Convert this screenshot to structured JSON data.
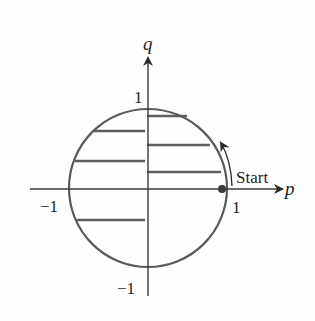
{
  "diagram": {
    "title": "",
    "axes": {
      "x_label": "p",
      "y_label": "q",
      "x_ticks": [
        {
          "value": -1,
          "label": "−1"
        },
        {
          "value": 1,
          "label": "1"
        }
      ],
      "y_ticks": [
        {
          "value": 1,
          "label": "1"
        },
        {
          "value": -1,
          "label": "−1"
        }
      ]
    },
    "circle": {
      "center": [
        0,
        0
      ],
      "radius": 1
    },
    "start_point": {
      "p": 1,
      "q": 0,
      "label": "Start"
    },
    "direction": "counterclockwise",
    "horizontal_segments": [
      {
        "side": "right",
        "q": 0.92
      },
      {
        "side": "right",
        "q": 0.55
      },
      {
        "side": "right",
        "q": 0.21
      },
      {
        "side": "left",
        "q": 0.73
      },
      {
        "side": "left",
        "q": 0.35
      },
      {
        "side": "left",
        "q": -0.39
      }
    ],
    "colors": {
      "circle": "#5a5a5a",
      "segments": "#5f5f5f",
      "axes": "#3a3a3a",
      "text": "#1e1e1e"
    }
  }
}
